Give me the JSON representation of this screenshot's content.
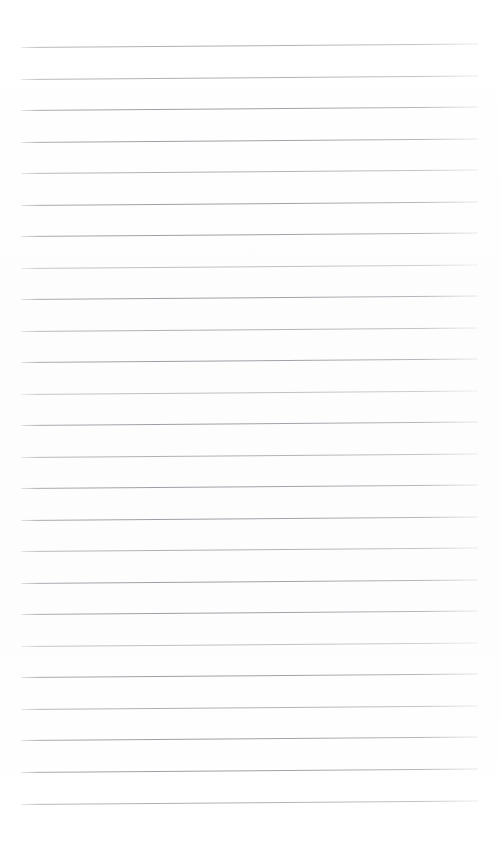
{
  "page": {
    "kind": "scanned-lined-paper",
    "width": 500,
    "height": 843,
    "background_color": "#fefefe",
    "content_text": "",
    "title": "",
    "notes_written": "none"
  },
  "ruling": {
    "line_color": "#a2a2aa",
    "line_count": 25,
    "line_thickness_px": 1,
    "spacing_px": 31.5,
    "left_margin_px": 21,
    "right_margin_px": 478,
    "first_line_y_px": 47,
    "last_line_y_px": 804,
    "skew_px": -3.6,
    "skew_deg": -0.45,
    "lines": [
      {
        "index": 1,
        "y": 47.0,
        "opacity": "faint"
      },
      {
        "index": 2,
        "y": 78.5,
        "opacity": "faint"
      },
      {
        "index": 3,
        "y": 110.0,
        "opacity": "normal"
      },
      {
        "index": 4,
        "y": 141.5,
        "opacity": "normal"
      },
      {
        "index": 5,
        "y": 173.0,
        "opacity": "faint"
      },
      {
        "index": 6,
        "y": 204.5,
        "opacity": "normal"
      },
      {
        "index": 7,
        "y": 236.0,
        "opacity": "normal"
      },
      {
        "index": 8,
        "y": 267.5,
        "opacity": "fainter"
      },
      {
        "index": 9,
        "y": 299.0,
        "opacity": "normal"
      },
      {
        "index": 10,
        "y": 330.5,
        "opacity": "faint"
      },
      {
        "index": 11,
        "y": 362.0,
        "opacity": "normal"
      },
      {
        "index": 12,
        "y": 393.5,
        "opacity": "fainter"
      },
      {
        "index": 13,
        "y": 425.0,
        "opacity": "normal"
      },
      {
        "index": 14,
        "y": 456.5,
        "opacity": "faint"
      },
      {
        "index": 15,
        "y": 488.0,
        "opacity": "normal"
      },
      {
        "index": 16,
        "y": 519.5,
        "opacity": "normal"
      },
      {
        "index": 17,
        "y": 551.0,
        "opacity": "faint"
      },
      {
        "index": 18,
        "y": 582.5,
        "opacity": "normal"
      },
      {
        "index": 19,
        "y": 614.0,
        "opacity": "normal"
      },
      {
        "index": 20,
        "y": 645.5,
        "opacity": "fainter"
      },
      {
        "index": 21,
        "y": 677.0,
        "opacity": "normal"
      },
      {
        "index": 22,
        "y": 708.5,
        "opacity": "faint"
      },
      {
        "index": 23,
        "y": 740.0,
        "opacity": "normal"
      },
      {
        "index": 24,
        "y": 772.0,
        "opacity": "normal"
      },
      {
        "index": 25,
        "y": 804.0,
        "opacity": "faint"
      }
    ]
  }
}
